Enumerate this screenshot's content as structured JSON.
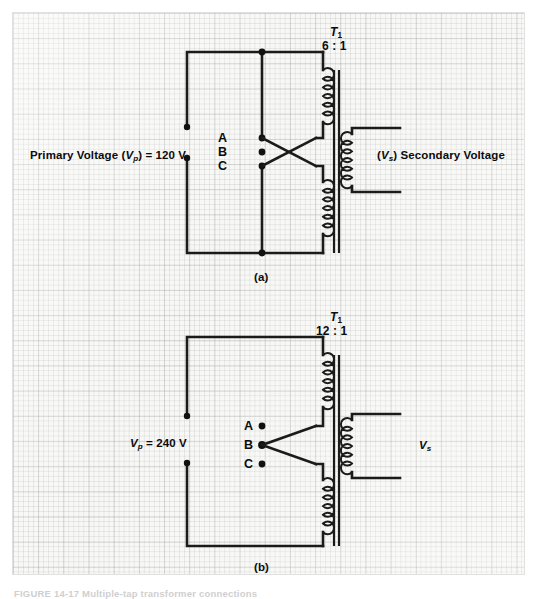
{
  "figure": {
    "caption": "FIGURE 14-17   Multiple-tap transformer connections",
    "panels": [
      {
        "id": "a",
        "caption": "(a)",
        "transformer_name": "T",
        "transformer_subscript": "1",
        "turns_ratio": "6 : 1",
        "primary_label_prefix": "Primary Voltage (",
        "primary_symbol": "V",
        "primary_symbol_sub": "p",
        "primary_label_suffix": ") = 120 V",
        "primary_voltage": "120 V",
        "secondary_symbol": "V",
        "secondary_symbol_sub": "s",
        "secondary_label": "Secondary Voltage",
        "taps": [
          "A",
          "B",
          "C"
        ],
        "connected_taps": [
          "A",
          "C"
        ],
        "connection_style": "crossed"
      },
      {
        "id": "b",
        "caption": "(b)",
        "transformer_name": "T",
        "transformer_subscript": "1",
        "turns_ratio": "12 : 1",
        "primary_symbol": "V",
        "primary_symbol_sub": "p",
        "primary_label_suffix": " = 240 V",
        "primary_voltage": "240 V",
        "secondary_symbol": "V",
        "secondary_symbol_sub": "s",
        "secondary_label": "",
        "taps": [
          "A",
          "B",
          "C"
        ],
        "connected_taps": [
          "B"
        ],
        "connection_style": "center-tap"
      }
    ]
  },
  "colors": {
    "ink": "#1b1b1b",
    "paper": "#f7f7f5",
    "grid_minor": "#bdbdbd",
    "grid_major": "#9a9a9a",
    "page": "#ffffff"
  }
}
